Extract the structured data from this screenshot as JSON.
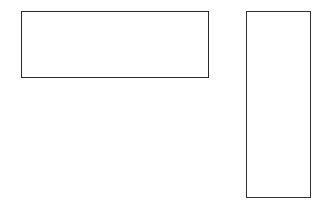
{
  "canvas": {
    "width": 330,
    "height": 209,
    "background_color": "#ffffff",
    "description": "Blank white page with two empty outlined rectangles"
  },
  "style": {
    "stroke_color": "#2a2a2e",
    "stroke_width_px": 1.4,
    "fill_color": "transparent"
  },
  "shapes": [
    {
      "id": "rect-wide",
      "label": "wide-rectangle",
      "x": 21,
      "y": 11,
      "width": 188,
      "height": 67,
      "stroke_color": "#2a2a2e",
      "stroke_width_px": 1.4,
      "fill_color": "transparent",
      "content": ""
    },
    {
      "id": "rect-tall",
      "label": "tall-rectangle",
      "x": 246,
      "y": 11,
      "width": 65,
      "height": 187,
      "stroke_color": "#303034",
      "stroke_width_px": 1.4,
      "fill_color": "transparent",
      "content": ""
    }
  ]
}
